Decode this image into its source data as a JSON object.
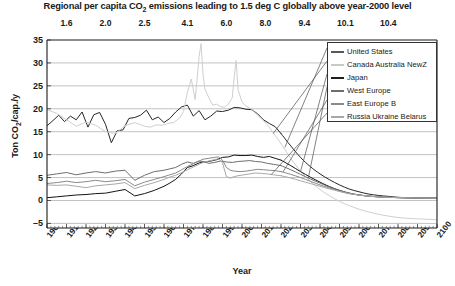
{
  "chart_data": {
    "type": "line",
    "title": "Regional per capita CO2 emissions leading to 1.5 deg C globally above year-2000 level",
    "title_parts": {
      "pre": "Regional per capita CO",
      "sub": "2",
      "post": " emissions leading to 1.5 deg C globally above year-2000 level"
    },
    "xlabel": "Year",
    "ylabel": "Ton CO2/cap./y",
    "ylabel_parts": {
      "pre": "Ton CO",
      "sub": "2",
      "post": "/cap./y"
    },
    "xlim": [
      1900,
      2100
    ],
    "ylim": [
      -6,
      35
    ],
    "grid": true,
    "legend_position": "top-right",
    "yticks": [
      35,
      30,
      25,
      20,
      15,
      10,
      5,
      0,
      -5
    ],
    "xticks": [
      1900,
      1910,
      1920,
      1930,
      1940,
      1950,
      1960,
      1970,
      1980,
      1990,
      2000,
      2010,
      2020,
      2030,
      2040,
      2050,
      2060,
      2070,
      2080,
      2090,
      2100
    ],
    "top_axis": {
      "label": "",
      "ticks": [
        {
          "value": "1.6",
          "year": 1910
        },
        {
          "value": "2.0",
          "year": 1930
        },
        {
          "value": "2.5",
          "year": 1950
        },
        {
          "value": "4.1",
          "year": 1972
        },
        {
          "value": "6.0",
          "year": 1992
        },
        {
          "value": "8.0",
          "year": 2012
        },
        {
          "value": "9.4",
          "year": 2032
        },
        {
          "value": "10.1",
          "year": 2053
        },
        {
          "value": "10.4",
          "year": 2075
        }
      ]
    },
    "legend": [
      {
        "name": "United States",
        "color": "#595959"
      },
      {
        "name": "Canada Australia NewZ",
        "color": "#c9c9c9"
      },
      {
        "name": "Japan",
        "color": "#1e1e1e"
      },
      {
        "name": "West Europe",
        "color": "#6e6e6e"
      },
      {
        "name": "East Europe B",
        "color": "#8a8a8a"
      },
      {
        "name": "Russia Ukraine Belarus",
        "color": "#a8a8a8"
      }
    ],
    "series": [
      {
        "name": "United States",
        "color": "#262626",
        "width": 1.0,
        "x": [
          1900,
          1903,
          1906,
          1909,
          1912,
          1915,
          1918,
          1921,
          1924,
          1927,
          1930,
          1933,
          1936,
          1939,
          1942,
          1945,
          1948,
          1951,
          1954,
          1957,
          1960,
          1963,
          1966,
          1969,
          1972,
          1975,
          1978,
          1981,
          1984,
          1987,
          1990,
          1993,
          1996,
          1999,
          2002,
          2005,
          2008,
          2011,
          2014,
          2017,
          2020,
          2025,
          2030,
          2035,
          2040,
          2045,
          2050,
          2055,
          2060,
          2065,
          2070,
          2075,
          2080,
          2085,
          2090,
          2095,
          2100
        ],
        "y": [
          16.3,
          17.4,
          18.6,
          17.2,
          18.4,
          17.6,
          19.3,
          16.0,
          18.7,
          19.2,
          16.6,
          12.6,
          15.2,
          15.4,
          17.9,
          18.1,
          18.6,
          19.7,
          17.6,
          18.2,
          17.0,
          17.9,
          19.3,
          20.4,
          20.8,
          18.4,
          19.6,
          17.6,
          18.4,
          19.5,
          19.4,
          19.7,
          20.3,
          20.2,
          19.9,
          19.8,
          18.9,
          17.6,
          16.8,
          16.1,
          14.6,
          11.9,
          9.4,
          7.4,
          5.8,
          4.5,
          3.4,
          2.5,
          1.9,
          1.4,
          1.1,
          0.9,
          0.7,
          0.6,
          0.55,
          0.5,
          0.5
        ]
      },
      {
        "name": "Canada Australia NewZ",
        "color": "#cfcfcf",
        "width": 1.0,
        "x": [
          1900,
          1905,
          1910,
          1915,
          1920,
          1925,
          1930,
          1935,
          1940,
          1945,
          1950,
          1953,
          1956,
          1959,
          1962,
          1965,
          1968,
          1970,
          1972,
          1974,
          1976,
          1978,
          1979,
          1980,
          1981,
          1983,
          1985,
          1987,
          1989,
          1991,
          1993,
          1995,
          1996,
          1997,
          1998,
          2000,
          2002,
          2005,
          2008,
          2011,
          2014,
          2017,
          2020,
          2025,
          2030,
          2035,
          2040,
          2045,
          2050,
          2055,
          2060,
          2065,
          2070,
          2075,
          2080,
          2085,
          2090,
          2095,
          2100
        ],
        "y": [
          19.8,
          19.0,
          17.6,
          16.2,
          17.1,
          16.4,
          15.0,
          14.6,
          16.3,
          17.0,
          16.2,
          16.0,
          16.5,
          16.4,
          16.8,
          17.0,
          18.0,
          19.4,
          23.6,
          26.5,
          22.0,
          31.4,
          34.2,
          27.6,
          24.3,
          22.4,
          20.8,
          21.0,
          20.5,
          20.3,
          21.0,
          22.4,
          26.9,
          30.5,
          24.1,
          21.5,
          20.6,
          19.9,
          18.6,
          17.4,
          16.0,
          14.2,
          12.4,
          9.2,
          6.4,
          4.2,
          2.4,
          1.0,
          -0.2,
          -1.1,
          -1.9,
          -2.5,
          -3.0,
          -3.4,
          -3.7,
          -3.9,
          -4.0,
          -4.1,
          -4.2
        ]
      },
      {
        "name": "Japan",
        "color": "#141414",
        "width": 1.0,
        "x": [
          1900,
          1905,
          1910,
          1915,
          1920,
          1925,
          1930,
          1935,
          1940,
          1945,
          1950,
          1955,
          1960,
          1963,
          1966,
          1969,
          1972,
          1975,
          1978,
          1981,
          1984,
          1987,
          1990,
          1993,
          1996,
          1999,
          2002,
          2005,
          2008,
          2011,
          2014,
          2017,
          2020,
          2025,
          2030,
          2035,
          2040,
          2045,
          2050,
          2055,
          2060,
          2065,
          2070,
          2075,
          2080,
          2085,
          2090,
          2095,
          2100
        ],
        "y": [
          0.6,
          0.8,
          1.0,
          1.2,
          1.3,
          1.5,
          1.6,
          2.0,
          2.4,
          1.0,
          1.5,
          2.2,
          3.1,
          3.8,
          4.6,
          5.8,
          7.2,
          7.6,
          8.2,
          8.4,
          8.6,
          8.9,
          9.4,
          9.5,
          9.9,
          9.8,
          9.8,
          9.9,
          9.6,
          9.4,
          9.6,
          9.2,
          8.8,
          7.6,
          6.3,
          5.1,
          4.0,
          3.0,
          2.2,
          1.6,
          1.2,
          0.95,
          0.8,
          0.7,
          0.62,
          0.58,
          0.55,
          0.52,
          0.5
        ]
      },
      {
        "name": "West Europe",
        "color": "#6e6e6e",
        "width": 1.0,
        "x": [
          1900,
          1905,
          1910,
          1915,
          1920,
          1925,
          1930,
          1935,
          1940,
          1945,
          1950,
          1955,
          1960,
          1963,
          1966,
          1969,
          1972,
          1975,
          1978,
          1980,
          1983,
          1986,
          1989,
          1992,
          1995,
          1998,
          2001,
          2004,
          2007,
          2010,
          2013,
          2016,
          2020,
          2025,
          2030,
          2035,
          2040,
          2045,
          2050,
          2055,
          2060,
          2065,
          2070,
          2075,
          2080,
          2085,
          2090,
          2095,
          2100
        ],
        "y": [
          5.5,
          5.8,
          6.1,
          5.6,
          6.0,
          6.3,
          6.0,
          6.4,
          6.6,
          4.4,
          5.5,
          6.3,
          6.6,
          6.9,
          7.2,
          7.9,
          8.4,
          8.1,
          8.6,
          8.5,
          8.1,
          8.3,
          8.6,
          8.4,
          8.3,
          8.5,
          8.6,
          8.7,
          8.5,
          8.4,
          8.1,
          7.9,
          7.6,
          6.7,
          5.7,
          4.7,
          3.8,
          2.9,
          2.2,
          1.6,
          1.2,
          0.95,
          0.8,
          0.7,
          0.62,
          0.58,
          0.55,
          0.52,
          0.5
        ]
      },
      {
        "name": "East Europe B",
        "color": "#8a8a8a",
        "width": 1.0,
        "x": [
          1900,
          1905,
          1910,
          1915,
          1920,
          1925,
          1930,
          1935,
          1940,
          1945,
          1950,
          1955,
          1960,
          1963,
          1966,
          1969,
          1972,
          1975,
          1978,
          1980,
          1983,
          1986,
          1988,
          1990,
          1992,
          1994,
          1996,
          1999,
          2002,
          2005,
          2008,
          2011,
          2014,
          2017,
          2020,
          2025,
          2030,
          2035,
          2040,
          2045,
          2050,
          2055,
          2060,
          2065,
          2070,
          2075,
          2080,
          2085,
          2090,
          2095,
          2100
        ],
        "y": [
          3.7,
          3.9,
          4.2,
          3.9,
          4.1,
          4.4,
          4.1,
          4.3,
          4.6,
          3.2,
          4.0,
          4.6,
          5.2,
          5.6,
          6.0,
          6.7,
          7.4,
          8.0,
          8.6,
          9.0,
          9.2,
          9.4,
          9.5,
          8.8,
          7.2,
          6.6,
          6.4,
          6.3,
          6.4,
          6.6,
          6.8,
          6.7,
          6.6,
          6.5,
          6.3,
          5.7,
          5.0,
          4.2,
          3.4,
          2.7,
          2.0,
          1.5,
          1.2,
          0.95,
          0.8,
          0.7,
          0.62,
          0.58,
          0.55,
          0.52,
          0.5
        ]
      },
      {
        "name": "Russia Ukraine Belarus",
        "color": "#a8a8a8",
        "width": 1.0,
        "x": [
          1900,
          1905,
          1910,
          1915,
          1920,
          1925,
          1930,
          1935,
          1940,
          1945,
          1950,
          1955,
          1960,
          1963,
          1966,
          1969,
          1972,
          1975,
          1978,
          1980,
          1983,
          1986,
          1988,
          1990,
          1992,
          1994,
          1996,
          1998,
          2001,
          2004,
          2007,
          2010,
          2013,
          2016,
          2020,
          2025,
          2030,
          2035,
          2040,
          2045,
          2050,
          2055,
          2060,
          2065,
          2070,
          2075,
          2080,
          2085,
          2090,
          2095,
          2100
        ],
        "y": [
          3.4,
          3.3,
          3.4,
          3.1,
          2.8,
          3.2,
          3.4,
          3.6,
          3.9,
          2.6,
          3.3,
          3.9,
          4.6,
          5.1,
          5.5,
          6.1,
          6.7,
          7.3,
          7.9,
          8.3,
          8.6,
          8.9,
          9.1,
          8.2,
          5.2,
          4.9,
          5.2,
          5.4,
          5.6,
          5.8,
          6.0,
          5.9,
          5.8,
          5.6,
          5.4,
          4.9,
          4.3,
          3.7,
          3.1,
          2.5,
          2.0,
          1.5,
          1.2,
          0.95,
          0.8,
          0.7,
          0.62,
          0.58,
          0.55,
          0.52,
          0.5
        ]
      }
    ],
    "leader_lines": [
      {
        "series": "United States",
        "from_year": 2022,
        "from_value": 11.6,
        "to_x": 327,
        "to_y": 48
      },
      {
        "series": "Canada Australia NewZ",
        "from_year": 2016,
        "from_value": 14.6,
        "to_x": 327,
        "to_y": 61
      },
      {
        "series": "Japan",
        "from_year": 2030,
        "from_value": 6.3,
        "to_x": 327,
        "to_y": 74
      },
      {
        "series": "West Europe",
        "from_year": 2034,
        "from_value": 4.9,
        "to_x": 327,
        "to_y": 87
      },
      {
        "series": "East Europe B",
        "from_year": 2021,
        "from_value": 6.2,
        "to_x": 327,
        "to_y": 100
      },
      {
        "series": "Russia Ukraine Belarus",
        "from_year": 2015,
        "from_value": 5.65,
        "to_x": 327,
        "to_y": 113
      }
    ]
  }
}
